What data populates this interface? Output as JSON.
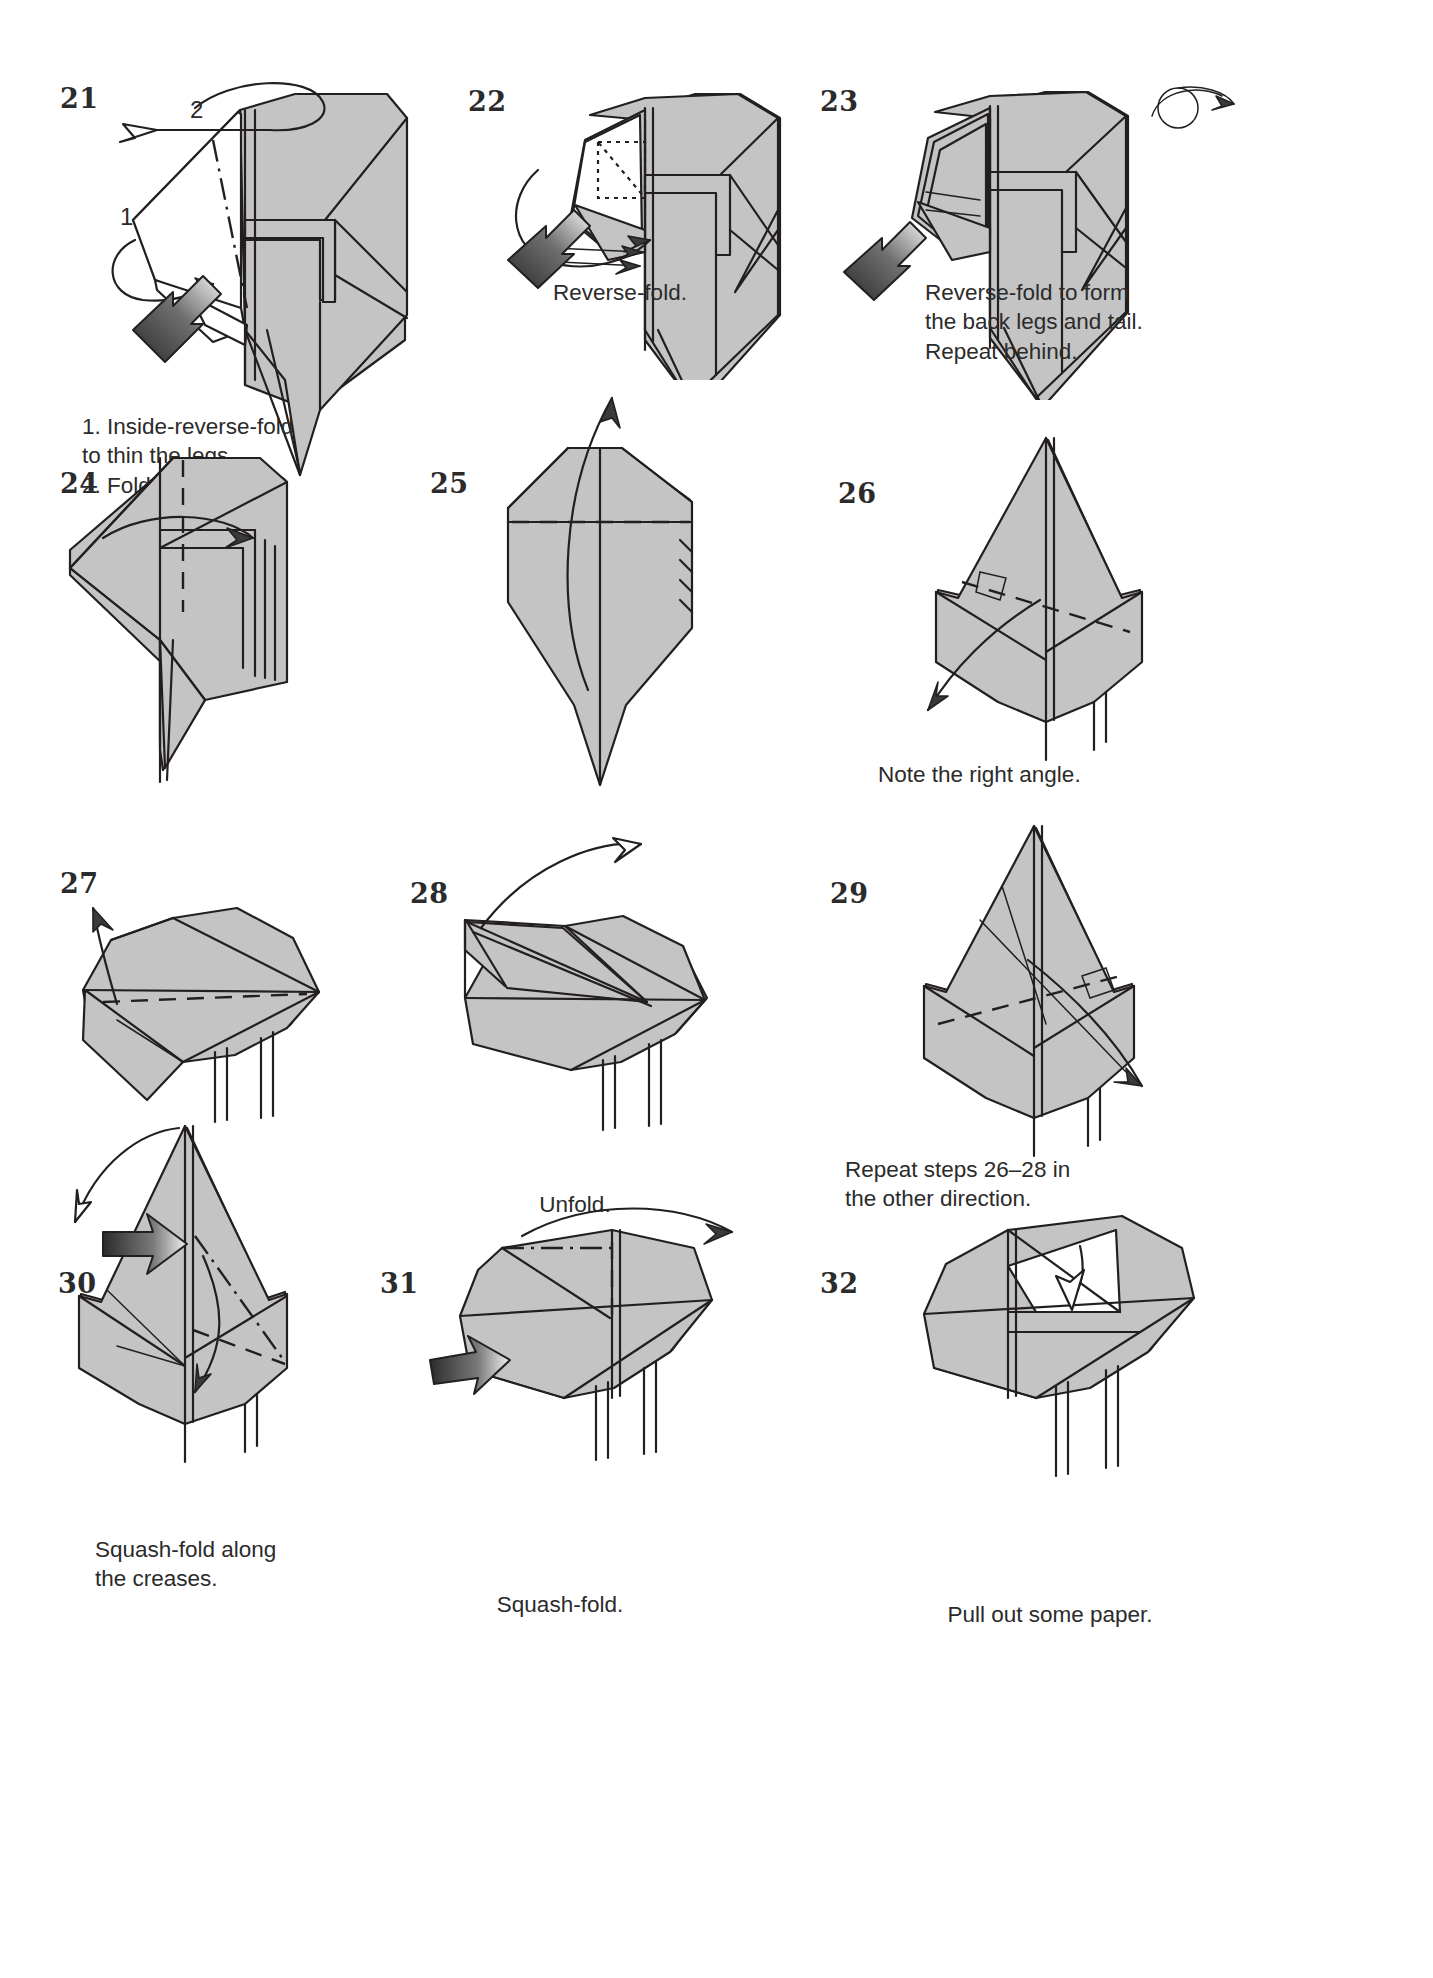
{
  "page": {
    "kind": "origami-instruction-diagram",
    "background_color": "#ffffff",
    "paper_fill": "#c4c4c4",
    "line_color": "#231f20",
    "width": 1433,
    "height": 1978
  },
  "steps": [
    {
      "number": "21",
      "caption": "1. Inside-reverse-fold\n    to thin the legs.\n2. Fold the tail out.",
      "sublabels": [
        "1",
        "2"
      ],
      "symbols": [
        "hollow-arrow-fold-out",
        "push-in-arrow",
        "mountain-crease",
        "valley-crease"
      ]
    },
    {
      "number": "22",
      "caption": "Reverse-fold.",
      "sublabels": [],
      "symbols": [
        "push-in-arrow",
        "hidden-edge-dotted",
        "thin-fold-arrow"
      ]
    },
    {
      "number": "23",
      "caption": "Reverse-fold to form\nthe back legs and tail.\nRepeat behind.",
      "sublabels": [],
      "symbols": [
        "push-in-arrow",
        "turn-over-symbol"
      ]
    },
    {
      "number": "24",
      "caption": "",
      "sublabels": [],
      "symbols": [
        "valley-crease",
        "curved-fold-arrow"
      ]
    },
    {
      "number": "25",
      "caption": "",
      "sublabels": [],
      "symbols": [
        "valley-crease",
        "long-unfold-arrow"
      ]
    },
    {
      "number": "26",
      "caption": "Note the right angle.",
      "sublabels": [],
      "symbols": [
        "valley-crease",
        "right-angle-marker",
        "fold-down-arrow"
      ]
    },
    {
      "number": "27",
      "caption": "",
      "sublabels": [],
      "symbols": [
        "valley-crease",
        "fold-up-arrow"
      ]
    },
    {
      "number": "28",
      "caption": "Unfold.",
      "sublabels": [],
      "symbols": [
        "unfold-arrow"
      ]
    },
    {
      "number": "29",
      "caption": "Repeat steps 26–28 in\nthe other direction.",
      "sublabels": [],
      "symbols": [
        "valley-crease",
        "right-angle-marker",
        "fold-arrow"
      ]
    },
    {
      "number": "30",
      "caption": "Squash-fold along\nthe creases.",
      "sublabels": [],
      "symbols": [
        "push-in-arrow",
        "valley-crease",
        "mountain-crease",
        "swing-arrow"
      ]
    },
    {
      "number": "31",
      "caption": "Squash-fold.",
      "sublabels": [],
      "symbols": [
        "push-in-arrow",
        "valley-crease",
        "mountain-crease",
        "swing-arrow"
      ]
    },
    {
      "number": "32",
      "caption": "Pull out some paper.",
      "sublabels": [],
      "symbols": [
        "hollow-arrow-pull-out"
      ]
    }
  ]
}
